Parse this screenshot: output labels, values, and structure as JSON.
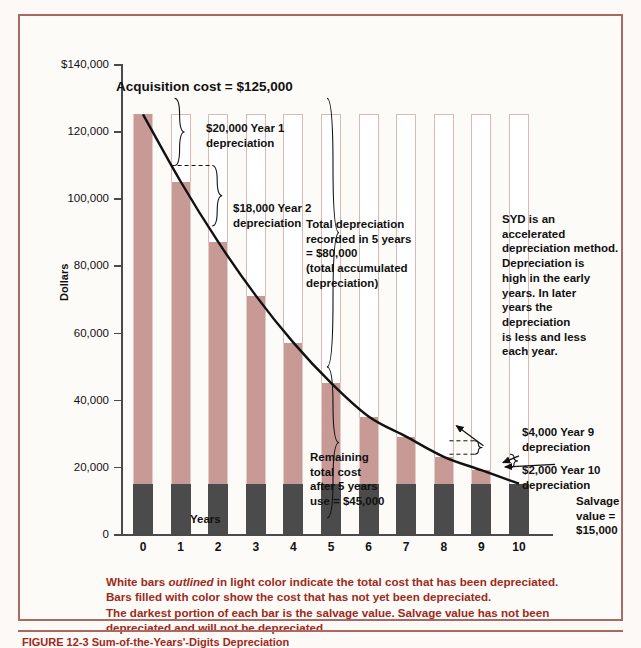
{
  "chart_data": {
    "type": "bar",
    "title": "Sum-of-the-Years'-Digits Depreciation",
    "xlabel": "Years",
    "ylabel": "Dollars",
    "ylim": [
      0,
      140000
    ],
    "grid": false,
    "legend": "none",
    "categories": [
      "0",
      "1",
      "2",
      "3",
      "4",
      "5",
      "6",
      "7",
      "8",
      "9",
      "10"
    ],
    "y_ticks": [
      "$140,000",
      "120,000",
      "100,000",
      "80,000",
      "60,000",
      "40,000",
      "20,000",
      "0"
    ],
    "y_tick_values": [
      140000,
      120000,
      100000,
      80000,
      60000,
      40000,
      20000,
      0
    ],
    "acquisition_cost": 125000,
    "salvage_value": 15000,
    "series": [
      {
        "name": "Total cost (outlined white bar)",
        "values": [
          125000,
          125000,
          125000,
          125000,
          125000,
          125000,
          125000,
          125000,
          125000,
          125000,
          125000
        ]
      },
      {
        "name": "Remaining book value (color fill)",
        "values": [
          125000,
          105000,
          87000,
          71000,
          57000,
          45000,
          35000,
          29000,
          23000,
          19000,
          15000
        ]
      },
      {
        "name": "Salvage value (dark portion)",
        "values": [
          15000,
          15000,
          15000,
          15000,
          15000,
          15000,
          15000,
          15000,
          15000,
          15000,
          15000
        ]
      },
      {
        "name": "Annual depreciation",
        "values": [
          0,
          20000,
          18000,
          16000,
          14000,
          12000,
          10000,
          8000,
          6000,
          4000,
          2000
        ]
      }
    ],
    "curve": {
      "name": "Book value curve",
      "x": [
        0,
        1,
        2,
        3,
        4,
        5,
        6,
        7,
        8,
        9,
        10
      ],
      "y": [
        125000,
        105000,
        87000,
        71000,
        57000,
        45000,
        35000,
        29000,
        23000,
        19000,
        15000
      ]
    },
    "annotations": [
      {
        "id": "acquisition",
        "text": "Acquisition cost = $125,000"
      },
      {
        "id": "year1",
        "text": "$20,000 Year 1\ndepreciation"
      },
      {
        "id": "year2",
        "text": "$18,000 Year 2\ndepreciation"
      },
      {
        "id": "total5",
        "text": "Total depreciation\nrecorded in 5 years\n= $80,000\n(total accumulated\ndepreciation)"
      },
      {
        "id": "syd-note",
        "text": "SYD is an accelerated\ndepreciation method.\nDepreciation is\nhigh in the early\nyears.  In later\nyears the depreciation\nis less and less\neach year."
      },
      {
        "id": "remaining",
        "text": "Remaining\ntotal cost\nafter 5 years\nuse = $45,000"
      },
      {
        "id": "year9",
        "text": "$4,000 Year 9\ndepreciation"
      },
      {
        "id": "year10",
        "text": "$2,000 Year 10\ndepreciation"
      },
      {
        "id": "salvage",
        "text": "Salvage value =\n$15,000"
      }
    ]
  },
  "axes": {
    "y_title": "Dollars",
    "x_title": "Years",
    "y_labels": [
      "$140,000",
      "120,000",
      "100,000",
      "80,000",
      "60,000",
      "40,000",
      "20,000",
      "0"
    ],
    "x_labels": [
      "0",
      "1",
      "2",
      "3",
      "4",
      "5",
      "6",
      "7",
      "8",
      "9",
      "10"
    ]
  },
  "annotations": {
    "acquisition": "Acquisition cost = $125,000",
    "year1": "$20,000 Year 1\ndepreciation",
    "year2": "$18,000 Year 2\ndepreciation",
    "total5": "Total depreciation\nrecorded in 5 years\n= $80,000\n(total accumulated\ndepreciation)",
    "syd_note": "SYD is an accelerated\ndepreciation method.\nDepreciation is\nhigh in the early\nyears.  In later\nyears the depreciation\nis less and less\neach year.",
    "remaining": "Remaining\ntotal cost\nafter 5 years\nuse = $45,000",
    "year9": "$4,000 Year 9\ndepreciation",
    "year10": "$2,000 Year 10\ndepreciation",
    "salvage": "Salvage value =\n$15,000"
  },
  "caption": {
    "line1_a": "White bars ",
    "line1_i": "outlined",
    "line1_b": " in light color indicate the total cost that has been depreciated.",
    "line2": "Bars filled with color show the cost that has not yet been depreciated.",
    "line3": "The darkest portion of each bar is the salvage value. Salvage value has not been",
    "line4": "depreciated and will not be depreciated."
  },
  "figure_title": "FIGURE 12-3  Sum-of-the-Years'-Digits Depreciation",
  "colors": {
    "frame": "#a86a62",
    "bar_fill": "#c79a96",
    "bar_outline": "#d8b9b4",
    "salvage": "#4b4b4b",
    "caption_text": "#9c2a20",
    "curve": "#111111",
    "background": "#fdfbf8"
  }
}
